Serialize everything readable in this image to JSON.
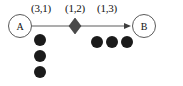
{
  "diagram": {
    "type": "petri-net-like-graph",
    "title": "",
    "nodes": [
      {
        "id": "A",
        "label": "A",
        "shape": "circle",
        "x": 8,
        "y": 14
      },
      {
        "id": "B",
        "label": "B",
        "shape": "circle",
        "x": 132,
        "y": 14
      }
    ],
    "transition": {
      "label": "diamond",
      "shape": "diamond",
      "fill": "#4a4a4a",
      "x": 75,
      "y": 26
    },
    "edge_labels": [
      {
        "text": "(3,1)",
        "x": 31,
        "y": 2
      },
      {
        "text": "(1,2)",
        "x": 65,
        "y": 2
      },
      {
        "text": "(1,3)",
        "x": 97,
        "y": 2
      }
    ],
    "arrow": {
      "from_x": 32,
      "to_x": 131,
      "y": 26,
      "color": "#5c5c5c",
      "has_arrowhead": true
    },
    "token_groups": [
      {
        "name": "left-token-column",
        "orientation": "vertical",
        "count": 3,
        "color": "#1b1b1b",
        "positions": [
          {
            "x": 34,
            "y": 34
          },
          {
            "x": 34,
            "y": 50
          },
          {
            "x": 34,
            "y": 66
          }
        ]
      },
      {
        "name": "right-token-row",
        "orientation": "horizontal",
        "count": 3,
        "color": "#1b1b1b",
        "positions": [
          {
            "x": 91,
            "y": 36
          },
          {
            "x": 106,
            "y": 36
          },
          {
            "x": 121,
            "y": 36
          }
        ]
      }
    ],
    "colors": {
      "background": "#ffffff",
      "node_stroke": "#5a5a5a",
      "text": "#111111",
      "token": "#1b1b1b",
      "transition_fill": "#4a4a4a",
      "edge": "#5c5c5c"
    }
  }
}
